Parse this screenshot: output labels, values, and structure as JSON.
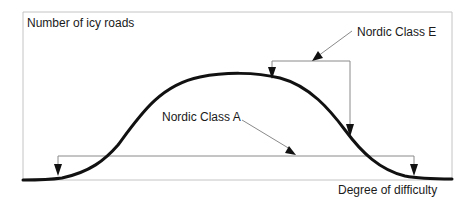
{
  "diagram": {
    "y_axis_label": "Number of icy roads",
    "x_axis_label": "Degree of difficulty",
    "annotations": [
      {
        "label": "Nordic Class A",
        "description": "wide range bracket spanning nearly the full curve"
      },
      {
        "label": "Nordic Class E",
        "description": "narrow range bracket on the upper/high-difficulty side of the peak"
      }
    ],
    "colors": {
      "curve": "#111111",
      "frame": "#bdbdbd",
      "bracket": "#8a8a8a",
      "arrow": "#111111",
      "text": "#1a1a1a"
    }
  }
}
